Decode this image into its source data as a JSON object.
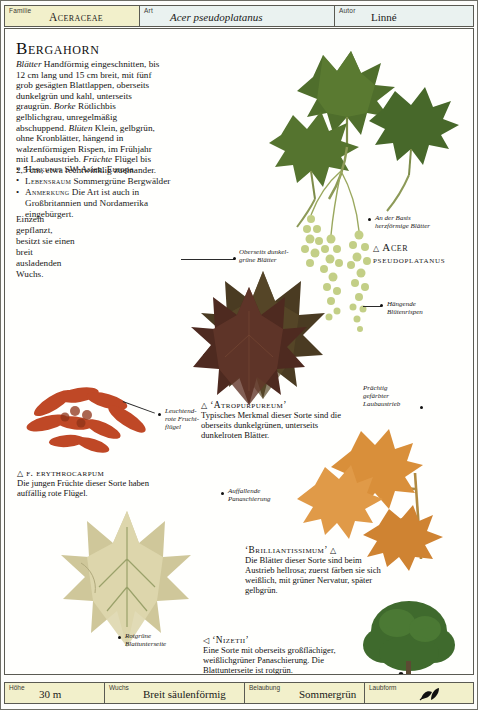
{
  "header": {
    "familie_key": "Familie",
    "familie_value": "Aceraceae",
    "art_key": "Art",
    "art_value": "Acer pseudoplatanus",
    "autor_key": "Autor",
    "autor_value": "Linné"
  },
  "title": "Bergahorn",
  "intro": {
    "t1": "Blätter",
    "p1": " Handförmig eingeschnitten, bis 12 cm lang und 15 cm breit, mit fünf grob gesägten Blattlappen, oberseits dunkelgrün und kahl, unterseits graugrün. ",
    "t2": "Borke",
    "p2": " Rötlichbis gelblichgrau, unregelmäßig abschuppend. ",
    "t3": "Blüten",
    "p3": " Klein, gelbgrün, ohne Kronblätter, hängend in walzenförmigen Rispen, im Frühjahr mit Laubaustrieb. ",
    "t4": "Früchte",
    "p4": " Flügel bis 2,5 cm, etwa rechtwinklig zueinander."
  },
  "bullets": [
    {
      "key": "Herkunft",
      "text": " SW-Asien, Europa"
    },
    {
      "key": "Lebensraum",
      "text": " Sommergrüne Bergwälder"
    },
    {
      "key": "Anmerkung",
      "text": " Die Art ist auch in Großbritannien und Nordamerika eingebürgert."
    }
  ],
  "narrow_text": "Einzeln gepflanzt, besitzt sie einen breit ausladenden Wuchs.",
  "pointer_labels": {
    "basis": "An der Basis\nherzförmige Blätter",
    "basis_l1": "An der Basis",
    "basis_l2": "herzförmige Blätter",
    "oberseits_l1": "Oberseits dunkel-",
    "oberseits_l2": "grüne Blätter",
    "haengende_l1": "Hängende",
    "haengende_l2": "Blütenrispen",
    "praechtig_l1": "Prächtig",
    "praechtig_l2": "gefärbter",
    "praechtig_l3": "Laubaustrieb",
    "leuchtend_l1": "Leuchtend-",
    "leuchtend_l2": "rote Frucht-",
    "leuchtend_l3": "flügel",
    "auffallende_l1": "Auffallende",
    "auffallende_l2": "Panaschierung",
    "rotgruene_l1": "Rotgrüne",
    "rotgruene_l2": "Blattunterseite"
  },
  "species_caption": {
    "triangle": "△",
    "line1": "Acer",
    "line2": "pseudoplatanus"
  },
  "captions": [
    {
      "id": "atropurpureum",
      "triangle": "△",
      "head": "‘Atropurpureum’",
      "body": "Typisches Merkmal dieser Sorte sind die oberseits dunkelgrünen, unterseits dunkelroten Blätter."
    },
    {
      "id": "erythrocarpum",
      "triangle": "△",
      "head": "f. erythrocarpum",
      "body": "Die jungen Früchte dieser Sorte haben auffällig rote Flügel."
    },
    {
      "id": "brilliantissimum",
      "triangle": "△",
      "head": "‘Brilliantissimum’",
      "body": "Die Blätter dieser Sorte sind beim Austrieb hellrosa; zuerst färben sie sich weißlich, mit grüner Nervatur, später gelbgrün."
    },
    {
      "id": "nizetii",
      "triangle": "◁",
      "head": "‘Nizetii’",
      "body": "Eine Sorte mit oberseits großflächiger, weißlichgrüner Panaschierung. Die Blattunterseite ist rotgrün."
    }
  ],
  "footer": {
    "hoehe_key": "Höhe",
    "hoehe_value": "30 m",
    "wuchs_key": "Wuchs",
    "wuchs_value": "Breit säulenförmig",
    "belaubung_key": "Belaubung",
    "belaubung_value": "Sommergrün",
    "laubform_key": "Laubform",
    "laubform_icon": "leaf-pair-icon"
  },
  "colors": {
    "header_familie_bg": "#f2f0cb",
    "header_art_bg": "#eaf2f0",
    "footer_bg": "#f2f0cb",
    "border": "#5a5a52",
    "leaf_dark_green": "#4d6b2a",
    "leaf_mid_green": "#6d8b3c",
    "leaf_purple": "#5a2d22",
    "fruit_red": "#c24a28",
    "variegated_cream": "#d8d2a8",
    "flower_green": "#b9c87a"
  }
}
